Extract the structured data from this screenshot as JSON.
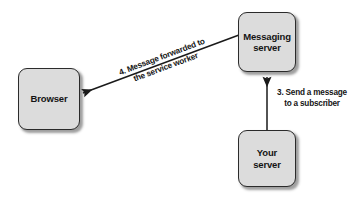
{
  "diagram": {
    "background_color": "#ffffff",
    "node_fill_color": "#dcdcdc",
    "node_border_color": "#2b2b2b",
    "text_color": "#141414",
    "nodes": [
      {
        "id": "browser",
        "label": "Browser"
      },
      {
        "id": "messaging_server",
        "label": "Messaging\nserver"
      },
      {
        "id": "your_server",
        "label": "Your\nserver"
      }
    ],
    "edges": [
      {
        "id": "forwarded",
        "from": "messaging_server",
        "to": "browser",
        "label": "4. Message forwarded to\nthe service worker",
        "step": "4"
      },
      {
        "id": "send",
        "from": "your_server",
        "to": "messaging_server",
        "label": "3. Send a message\nto a subscriber",
        "step": "3"
      }
    ]
  }
}
